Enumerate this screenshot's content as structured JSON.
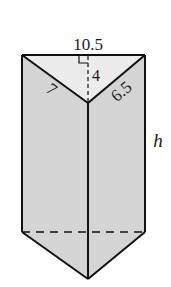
{
  "figure": {
    "type": "triangular prism",
    "colors": {
      "front_face": "#d4d4d4",
      "top_face": "#ececec",
      "stroke": "#111111",
      "background": "#ffffff"
    },
    "labels": {
      "base_width": "10.5",
      "triangle_height": "4",
      "left_slant": "7",
      "right_slant": "6.5",
      "prism_height": "h"
    },
    "markers": {
      "right_angle": true,
      "hidden_edge_dashed": true
    }
  }
}
